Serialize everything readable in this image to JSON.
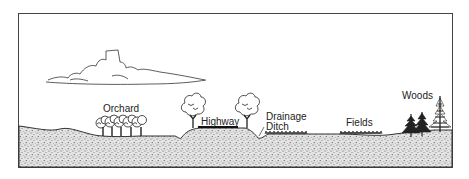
{
  "diagram": {
    "type": "landscape cross-section",
    "labels": {
      "orchard": "Orchard",
      "highway": "Highway",
      "drainage_ditch_line1": "Drainage",
      "drainage_ditch_line2": "Ditch",
      "fields": "Fields",
      "woods": "Woods"
    },
    "colors": {
      "ink": "#222222",
      "ground_fill": "#d9d9d9",
      "background": "#ffffff"
    }
  }
}
